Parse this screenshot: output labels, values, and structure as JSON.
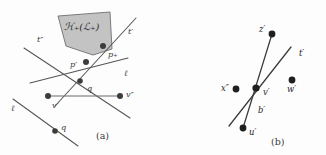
{
  "figure": {
    "background_color": "#fdfdfd",
    "line_color": "#555555",
    "dot_color": "#3c3c3c",
    "region_color": "#b9b9b9",
    "panels": [
      {
        "id": "a",
        "caption": "(a)",
        "caption_x": 96,
        "caption_y": 139,
        "region": {
          "label": "ℋ₊(ℒ₊)",
          "label_x": 64,
          "label_y": 30,
          "polygon": "58,16 110,12 112,49 93,55 66,46"
        },
        "lines": [
          {
            "name": "line-t-double-prime",
            "x1": 24,
            "y1": 48,
            "x2": 130,
            "y2": 118
          },
          {
            "name": "line-t-prime",
            "x1": 136,
            "y1": 18,
            "x2": 55,
            "y2": 106
          },
          {
            "name": "line-ell-right",
            "x1": 30,
            "y1": 83,
            "x2": 128,
            "y2": 58
          },
          {
            "name": "line-ell-left",
            "x1": 13,
            "y1": 99,
            "x2": 78,
            "y2": 146
          },
          {
            "name": "line-region-left-edge",
            "x1": 58,
            "y1": 16,
            "x2": 93,
            "y2": 55
          },
          {
            "name": "line-region-right-edge",
            "x1": 112,
            "y1": 49,
            "x2": 93,
            "y2": 55
          }
        ],
        "segments": [
          {
            "name": "segment-q",
            "x1": 48,
            "y1": 96,
            "x2": 120,
            "y2": 96
          }
        ],
        "points": [
          {
            "name": "point-p-plus",
            "label": "p₊",
            "x": 103,
            "y": 46,
            "lx": 108,
            "ly": 57,
            "r": 3.0
          },
          {
            "name": "point-p-prime",
            "label": "p′",
            "x": 86,
            "y": 62,
            "lx": 70,
            "ly": 67,
            "r": 3.0
          },
          {
            "name": "point-mid-ell",
            "label": "",
            "x": 80,
            "y": 81,
            "lx": 0,
            "ly": 0,
            "r": 2.8
          },
          {
            "name": "point-v-prime",
            "label": "v′",
            "x": 48,
            "y": 96,
            "lx": 52,
            "ly": 108,
            "r": 3.0
          },
          {
            "name": "point-v-double-prime",
            "label": "v″",
            "x": 120,
            "y": 96,
            "lx": 126,
            "ly": 97,
            "r": 3.0
          },
          {
            "name": "point-q",
            "label": "q",
            "x": 55,
            "y": 131,
            "lx": 61,
            "ly": 130,
            "r": 2.8
          }
        ],
        "line_labels": [
          {
            "name": "label-t-double-prime",
            "text": "t″",
            "x": 37,
            "y": 42
          },
          {
            "name": "label-t-prime",
            "text": "t′",
            "x": 128,
            "y": 34
          },
          {
            "name": "label-ell-right",
            "text": "ℓ",
            "x": 124,
            "y": 76
          },
          {
            "name": "label-ell-left",
            "text": "ℓ",
            "x": 11,
            "y": 111
          },
          {
            "name": "label-q-segment",
            "text": "q",
            "x": 87,
            "y": 91
          }
        ]
      },
      {
        "id": "b",
        "caption": "(b)",
        "caption_x": 271,
        "caption_y": 145,
        "lines": [
          {
            "name": "line-z-prime-to-u-prime",
            "x1": 272,
            "y1": 34,
            "x2": 243,
            "y2": 128
          },
          {
            "name": "line-t-prime-b",
            "x1": 291,
            "y1": 47,
            "x2": 229,
            "y2": 126
          }
        ],
        "points": [
          {
            "name": "point-z-prime",
            "label": "z′",
            "x": 272,
            "y": 34,
            "lx": 259,
            "ly": 32,
            "r": 3.4
          },
          {
            "name": "point-x-double-prime",
            "label": "x″",
            "x": 236,
            "y": 89,
            "lx": 222,
            "ly": 90,
            "r": 3.4
          },
          {
            "name": "point-v-prime-b",
            "label": "v′",
            "x": 256,
            "y": 88,
            "lx": 263,
            "ly": 95,
            "r": 3.6
          },
          {
            "name": "point-w-prime",
            "label": "w′",
            "x": 292,
            "y": 80,
            "lx": 287,
            "ly": 92,
            "r": 3.4
          },
          {
            "name": "point-u-prime",
            "label": "u′",
            "x": 243,
            "y": 128,
            "lx": 249,
            "ly": 134,
            "r": 3.4
          }
        ],
        "line_labels": [
          {
            "name": "label-t-prime-b",
            "text": "t′",
            "x": 299,
            "y": 56
          },
          {
            "name": "label-b-prime",
            "text": "b′",
            "x": 258,
            "y": 112
          }
        ]
      }
    ]
  }
}
